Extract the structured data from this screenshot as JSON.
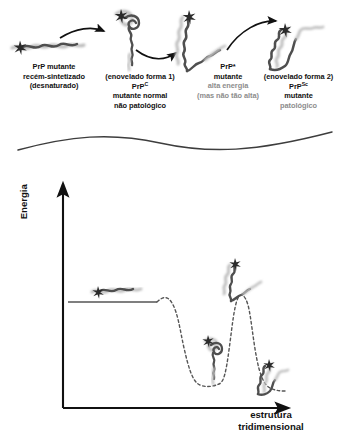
{
  "diagram": {
    "language": "pt-BR",
    "colors": {
      "ink": "#111111",
      "gray_text": "#8d8d8d",
      "chain_dark": "#4a4a4a",
      "chain_light": "#b5b5b5",
      "curve": "#555555",
      "axis": "#111111",
      "background": "#ffffff"
    }
  },
  "top_panel": {
    "states": [
      {
        "id": "state-1",
        "icon": "unfolded-chain-icon",
        "caption": [
          {
            "text": "PrP mutante",
            "style": "dark"
          },
          {
            "text": "recém-sintetizado",
            "style": "dark"
          },
          {
            "text": "(desnaturado)",
            "style": "dark"
          }
        ]
      },
      {
        "id": "state-2",
        "icon": "partially-folded-loop-icon",
        "caption": [
          {
            "text": "(enovelado forma 1)",
            "style": "dark"
          },
          {
            "text": "PrP",
            "sup": "C",
            "style": "dark"
          },
          {
            "text": "mutante normal",
            "style": "dark"
          },
          {
            "text": "não patológico",
            "style": "dark"
          }
        ]
      },
      {
        "id": "state-3",
        "icon": "helical-intermediate-icon",
        "caption": [
          {
            "text": "PrP*",
            "style": "dark"
          },
          {
            "text": "mutante",
            "style": "dark"
          },
          {
            "text": "alta energia",
            "style": "gray"
          },
          {
            "text": "(mas não tão alta)",
            "style": "gray"
          }
        ]
      },
      {
        "id": "state-4",
        "icon": "beta-sheet-aggregate-icon",
        "caption": [
          {
            "text": "(enovelado forma 2)",
            "style": "dark"
          },
          {
            "text": "PrP",
            "sup": "Sc",
            "style": "dark"
          },
          {
            "text": "mutante",
            "style": "dark"
          },
          {
            "text": "patológico",
            "style": "gray"
          }
        ]
      }
    ],
    "arrows": [
      {
        "id": "arrow-1",
        "from": "state-1",
        "to": "state-2"
      },
      {
        "id": "arrow-2",
        "from": "state-2",
        "to": "state-3"
      },
      {
        "id": "arrow-3",
        "from": "state-3",
        "to": "state-4"
      }
    ],
    "divider": {
      "id": "wavy-divider",
      "shape": "s-curve"
    }
  },
  "chart_data": {
    "type": "line",
    "title": "",
    "xlabel": "estrutura tridimensional",
    "ylabel": "Energia",
    "xlim": [
      0,
      100
    ],
    "ylim": [
      0,
      100
    ],
    "grid": false,
    "legend": false,
    "axis_ticks": false,
    "series": [
      {
        "name": "plateau (estado desnaturado)",
        "style": "solid",
        "x": [
          7,
          52
        ],
        "y": [
          58,
          58
        ]
      },
      {
        "name": "perfil de energia",
        "style": "dashed",
        "x": [
          52,
          56,
          59,
          62,
          65,
          68,
          71,
          74,
          78,
          80,
          82,
          84,
          86,
          88,
          90,
          92,
          94,
          96,
          98,
          100
        ],
        "y": [
          58,
          59,
          57,
          50,
          38,
          26,
          17,
          12,
          11,
          12,
          22,
          45,
          68,
          75,
          66,
          42,
          22,
          10,
          5,
          4
        ]
      }
    ],
    "annotations": [
      {
        "id": "icon-unfolded",
        "label": "unfolded-chain-icon",
        "x": 22,
        "y": 64,
        "note": "PrP desnaturado no platô"
      },
      {
        "id": "icon-form1",
        "label": "partially-folded-loop-icon",
        "x": 72,
        "y": 28,
        "note": "PrP C no poço de energia"
      },
      {
        "id": "icon-prp-star",
        "label": "helical-intermediate-icon",
        "x": 87,
        "y": 84,
        "note": "PrP* no topo da barreira"
      },
      {
        "id": "icon-form2",
        "label": "beta-sheet-aggregate-icon",
        "x": 97,
        "y": 13,
        "note": "PrP Sc no poço final"
      }
    ]
  }
}
